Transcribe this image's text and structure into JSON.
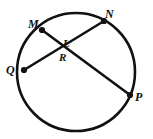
{
  "figure": {
    "type": "circle-with-two-intersecting-chords",
    "stroke_color": "#111111",
    "background_color": "#ffffff",
    "point_color": "#111111",
    "circle": {
      "center_x": 76,
      "center_y": 72,
      "radius": 59,
      "stroke_width": 2.6
    },
    "points": [
      {
        "id": "M",
        "label": "M",
        "x": 42,
        "y": 30,
        "dot_radius": 3.1
      },
      {
        "id": "N",
        "label": "N",
        "x": 104,
        "y": 21,
        "dot_radius": 3.1
      },
      {
        "id": "P",
        "label": "P",
        "x": 130,
        "y": 95,
        "dot_radius": 3.1
      },
      {
        "id": "Q",
        "label": "Q",
        "x": 24,
        "y": 70,
        "dot_radius": 3.1
      }
    ],
    "interior_labels": [
      {
        "id": "L",
        "label": "L",
        "x": 66,
        "y": 43
      },
      {
        "id": "R",
        "label": "R",
        "x": 62,
        "y": 57
      }
    ],
    "chords": [
      {
        "id": "MP",
        "from": "M",
        "to": "P",
        "x1": 42,
        "y1": 30,
        "x2": 130,
        "y2": 95,
        "stroke_width": 2.6
      },
      {
        "id": "QN",
        "from": "Q",
        "to": "N",
        "x1": 24,
        "y1": 70,
        "x2": 104,
        "y2": 21,
        "stroke_width": 2.6
      }
    ],
    "intersection": {
      "x": 63,
      "y": 48
    }
  }
}
